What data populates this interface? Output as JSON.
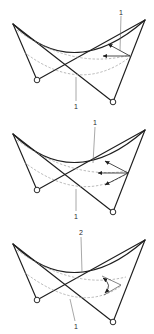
{
  "figure": {
    "colors": {
      "paper": "#ffffff",
      "ink": "#1f1f1f",
      "dash": "#999999",
      "leader": "#5f5f5f",
      "label": "#262626"
    },
    "diagrams": [
      {
        "name": "hypar-stage-1",
        "top_label": "1",
        "bottom_label": "1",
        "annotation_kind": "two-displacement-arrows"
      },
      {
        "name": "hypar-stage-2",
        "top_label": "1",
        "bottom_label": "1",
        "annotation_kind": "three-displacement-arrows"
      },
      {
        "name": "hypar-stage-3",
        "top_label": "2",
        "bottom_label": "1",
        "annotation_kind": "rotation-arc-arrows"
      }
    ]
  }
}
